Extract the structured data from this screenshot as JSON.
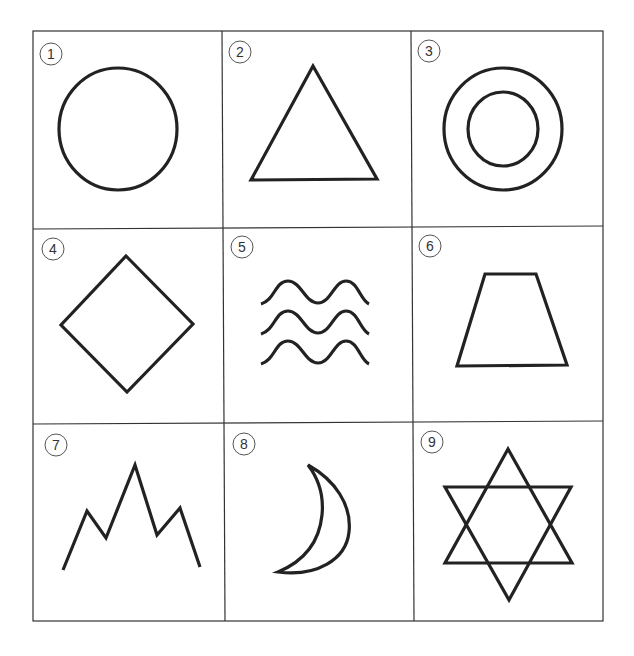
{
  "grid": {
    "rows": 3,
    "cols": 3,
    "line_color": "#333333",
    "stroke_color": "#222222"
  },
  "cells": [
    {
      "number": "1",
      "shape": "circle"
    },
    {
      "number": "2",
      "shape": "triangle"
    },
    {
      "number": "3",
      "shape": "concentric-circles"
    },
    {
      "number": "4",
      "shape": "diamond"
    },
    {
      "number": "5",
      "shape": "waves"
    },
    {
      "number": "6",
      "shape": "trapezoid"
    },
    {
      "number": "7",
      "shape": "mountains"
    },
    {
      "number": "8",
      "shape": "crescent-moon"
    },
    {
      "number": "9",
      "shape": "six-pointed-star"
    }
  ]
}
